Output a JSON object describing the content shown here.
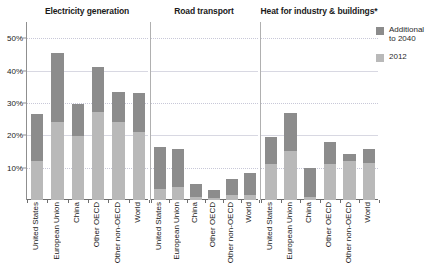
{
  "chart_data": {
    "type": "bar",
    "title": "",
    "subtitle": "",
    "xlabel": "",
    "ylabel": "",
    "ylim": [
      0,
      55
    ],
    "yticks": [
      10,
      20,
      30,
      40,
      50
    ],
    "ytick_labels": [
      "10%",
      "20%",
      "30%",
      "40%",
      "50%"
    ],
    "grid": true,
    "stacked": true,
    "legend_position": "right",
    "categories": [
      "United States",
      "European Union",
      "China",
      "Other OECD",
      "Other non-OECD",
      "World"
    ],
    "series": [
      {
        "name": "2012",
        "color": "#b9b9b9"
      },
      {
        "name": "Additional to 2040",
        "color": "#8c8c8c"
      }
    ],
    "panels": [
      {
        "title": "Electricity generation",
        "values_2012": [
          12.2,
          24.0,
          19.8,
          27.3,
          24.0,
          21.0
        ],
        "values_additional": [
          14.5,
          21.5,
          10.0,
          13.7,
          9.5,
          12.0
        ],
        "totals": [
          26.7,
          45.5,
          29.8,
          41.0,
          33.5,
          33.0
        ]
      },
      {
        "title": "Road transport",
        "values_2012": [
          3.4,
          4.0,
          0.8,
          0.5,
          1.5,
          1.6
        ],
        "values_additional": [
          13.1,
          11.8,
          4.2,
          2.6,
          5.0,
          6.9
        ],
        "totals": [
          16.5,
          15.8,
          5.0,
          3.1,
          6.5,
          8.5
        ]
      },
      {
        "title": "Heat for industry & buildings*",
        "values_2012": [
          11.2,
          15.0,
          1.0,
          11.0,
          12.0,
          11.5
        ],
        "values_additional": [
          8.3,
          11.8,
          9.0,
          7.0,
          2.2,
          4.3
        ],
        "totals": [
          19.5,
          26.8,
          10.0,
          18.0,
          14.2,
          15.8
        ]
      }
    ]
  },
  "legend": {
    "items": [
      {
        "label": "Additional\nto 2040",
        "color": "#8c8c8c"
      },
      {
        "label": "2012",
        "color": "#b9b9b9"
      }
    ]
  }
}
